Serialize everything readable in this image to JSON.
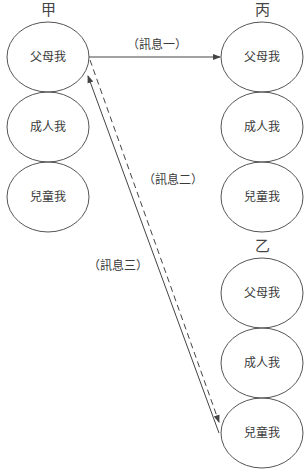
{
  "diagram": {
    "type": "transactional-analysis-message-flow",
    "parties": [
      {
        "id": "jia",
        "title": "甲",
        "states": [
          "父母我",
          "成人我",
          "兒童我"
        ]
      },
      {
        "id": "bing",
        "title": "丙",
        "states": [
          "父母我",
          "成人我",
          "兒童我"
        ]
      },
      {
        "id": "yi",
        "title": "乙",
        "states": [
          "父母我",
          "成人我",
          "兒童我"
        ]
      }
    ],
    "messages": [
      {
        "label": "（訊息一）",
        "from": "甲.父母我",
        "to": "丙.父母我",
        "style": "solid"
      },
      {
        "label": "（訊息二）",
        "from": "甲.父母我",
        "to": "乙.兒童我",
        "style": "dashed"
      },
      {
        "label": "（訊息三）",
        "from": "乙.兒童我",
        "to": "甲.父母我",
        "style": "solid"
      }
    ]
  },
  "colors": {
    "stroke": "#555555",
    "text": "#3a3a3a",
    "background": "#ffffff"
  }
}
